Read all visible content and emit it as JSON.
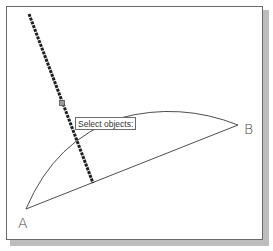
{
  "tooltip": {
    "text": "Select objects:"
  },
  "points": {
    "A": {
      "label": "A"
    },
    "B": {
      "label": "B"
    }
  },
  "colors": {
    "frame": "#6a6a6a",
    "shadow": "#bdbdbd",
    "geometry": "#3a3a3a",
    "selected_line": "#1f1f1f"
  }
}
